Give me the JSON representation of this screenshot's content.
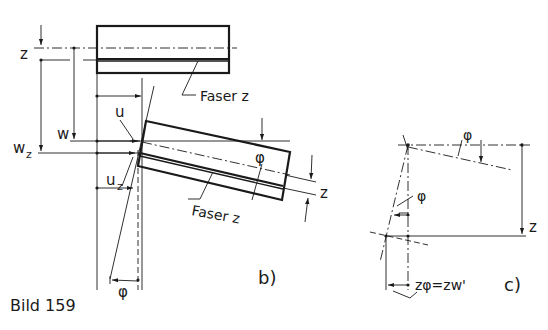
{
  "figure": {
    "caption": "Bild 159",
    "colors": {
      "ink": "#1a1a1a",
      "background": "#ffffff"
    }
  },
  "part_b": {
    "label": "b)",
    "upper_beam": {
      "fiber_label": "Faser z"
    },
    "rotated_beam": {
      "fiber_label": "Faser z",
      "angle_label": "φ"
    },
    "dimensions": {
      "z_top": "z",
      "w": "w",
      "w_z": "w",
      "w_z_sub": "z",
      "u": "u",
      "u_z": "u",
      "u_z_sub": "z",
      "z_right": "z",
      "phi_bottom": "φ"
    }
  },
  "part_c": {
    "label": "c)",
    "phi_top": "φ",
    "phi_mid": "φ",
    "z_right": "z",
    "equation": "zφ=zw'"
  }
}
